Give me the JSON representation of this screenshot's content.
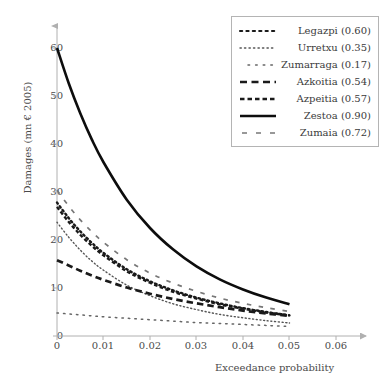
{
  "chart_data": {
    "type": "line",
    "title": "",
    "xlabel": "Exceedance probability",
    "ylabel": "Damages (mn € 2005)",
    "xlim": [
      0,
      0.065
    ],
    "ylim": [
      0,
      64
    ],
    "xticks": [
      "0",
      "0.01",
      "0.02",
      "0.03",
      "0.04",
      "0.05",
      "0.06"
    ],
    "xtick_values": [
      0,
      0.01,
      0.02,
      0.03,
      0.04,
      0.05,
      0.06
    ],
    "yticks": [
      "0",
      "10",
      "20",
      "30",
      "40",
      "50",
      "60"
    ],
    "ytick_values": [
      0,
      10,
      20,
      30,
      40,
      50,
      60
    ],
    "grid": false,
    "legend_position": "top-right",
    "x": [
      0,
      0.0025,
      0.005,
      0.0075,
      0.01,
      0.015,
      0.02,
      0.025,
      0.03,
      0.035,
      0.04,
      0.045,
      0.05
    ],
    "series": [
      {
        "name": "Legazpi",
        "label": "Legazpi (0.60)",
        "value": "0.60",
        "style": "dotted",
        "color": "#1a1a1a",
        "values": [
          27.8,
          24.6,
          21.8,
          19.4,
          17.3,
          13.9,
          11.4,
          9.5,
          8.0,
          6.8,
          5.8,
          5.0,
          4.3
        ]
      },
      {
        "name": "Urretxu",
        "label": "Urretxu (0.35)",
        "value": "0.35",
        "style": "fine-dotted",
        "color": "#555555",
        "values": [
          23.7,
          20.6,
          17.9,
          15.6,
          13.7,
          10.6,
          8.4,
          6.7,
          5.5,
          4.5,
          3.8,
          3.2,
          2.7
        ]
      },
      {
        "name": "Zumarraga",
        "label": "Zumarraga (0.17)",
        "value": "0.17",
        "style": "sparse-dotted",
        "color": "#666666",
        "values": [
          4.8,
          4.6,
          4.4,
          4.2,
          4.0,
          3.7,
          3.4,
          3.1,
          2.8,
          2.6,
          2.4,
          2.2,
          2.0
        ]
      },
      {
        "name": "Azkoitia",
        "label": "Azkoitia (0.54)",
        "value": "0.54",
        "style": "dashed",
        "color": "#1a1a1a",
        "values": [
          15.8,
          14.7,
          13.6,
          12.6,
          11.7,
          10.1,
          8.8,
          7.7,
          6.8,
          6.0,
          5.3,
          4.7,
          4.2
        ]
      },
      {
        "name": "Azpeitia",
        "label": "Azpeitia (0.57)",
        "value": "0.57",
        "style": "short-dashed",
        "color": "#1a1a1a",
        "values": [
          26.9,
          23.8,
          21.1,
          18.8,
          16.8,
          13.5,
          11.1,
          9.2,
          7.8,
          6.6,
          5.7,
          4.9,
          4.3
        ]
      },
      {
        "name": "Zestoa",
        "label": "Zestoa (0.90)",
        "value": "0.90",
        "style": "solid",
        "color": "#0d0d0d",
        "values": [
          60.0,
          52.7,
          46.4,
          40.9,
          36.2,
          28.4,
          22.5,
          18.0,
          14.5,
          11.8,
          9.7,
          8.0,
          6.6
        ]
      },
      {
        "name": "Zumaia",
        "label": "Zumaia (0.72)",
        "value": "0.72",
        "style": "dash-dot",
        "color": "#777777",
        "values": [
          30.4,
          27.1,
          24.2,
          21.7,
          19.5,
          15.9,
          13.1,
          11.0,
          9.3,
          7.9,
          6.8,
          5.9,
          5.1
        ]
      }
    ]
  },
  "axes": {
    "x_title": "Exceedance probability",
    "y_title": "Damages (mn € 2005)"
  },
  "legend": {
    "items": [
      {
        "label": "Legazpi (0.60)"
      },
      {
        "label": "Urretxu (0.35)"
      },
      {
        "label": "Zumarraga (0.17)"
      },
      {
        "label": "Azkoitia (0.54)"
      },
      {
        "label": "Azpeitia (0.57)"
      },
      {
        "label": "Zestoa (0.90)"
      },
      {
        "label": "Zumaia (0.72)"
      }
    ]
  },
  "colors": {
    "axis": "#b0b0b0",
    "text": "#3a3a3a",
    "curve_dark": "#1a1a1a",
    "curve_grey": "#777777",
    "legend_border": "#b4b4b4"
  }
}
